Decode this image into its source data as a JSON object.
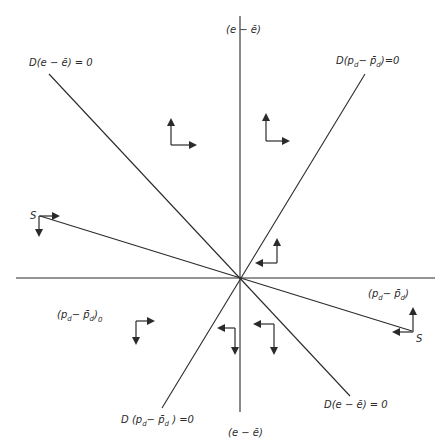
{
  "diagram": {
    "type": "phase-diagram",
    "axes": {
      "vertical_top_label": "(e − ē)",
      "vertical_bottom_label": "(e − ē)",
      "horizontal_label_main": "(p",
      "horizontal_label_sub": "d",
      "horizontal_label_rest": "− p̄",
      "horizontal_label_sub2": "d",
      "horizontal_label_close": ")"
    },
    "lines": {
      "de_top": "D(e − ē) = 0",
      "de_bottom": "D(e − ē) = 0",
      "dp_top_D": "D(p",
      "dp_top_sub": "d",
      "dp_top_mid": "− p̄",
      "dp_top_sub2": "d",
      "dp_top_end": ")=0",
      "dp_bottom_D": "D (p",
      "dp_bottom_sub": "d",
      "dp_bottom_mid": "− p̄",
      "dp_bottom_sub2": "d",
      "dp_bottom_end": " ) =0",
      "s_left": "S",
      "s_right": "S"
    },
    "initial_point": {
      "main": "(p",
      "sub": "d",
      "mid": "− p̄",
      "sub2": "d",
      "close": ")",
      "sub3": "0"
    }
  }
}
